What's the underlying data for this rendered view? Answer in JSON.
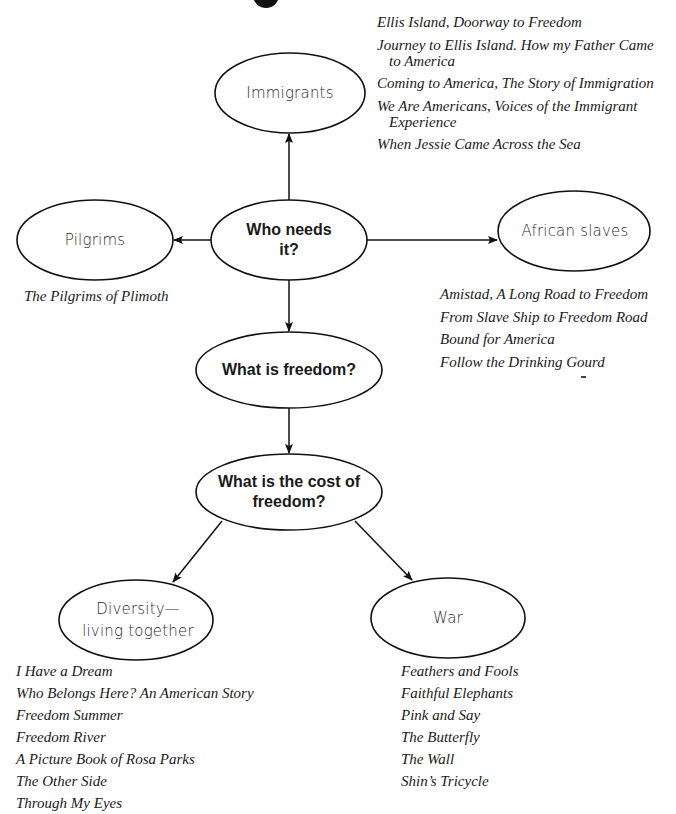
{
  "diagram": {
    "stroke_color": "#111111",
    "nodes": {
      "immigrants": {
        "label": "Immigrants"
      },
      "who_needs_it": {
        "label_line1": "Who needs",
        "label_line2": "it?"
      },
      "pilgrims": {
        "label": "Pilgrims"
      },
      "african_slaves": {
        "label": "African slaves"
      },
      "what_is_freedom": {
        "label": "What is freedom?"
      },
      "cost_of_freedom": {
        "label_line1": "What is the cost of",
        "label_line2": "freedom?"
      },
      "diversity": {
        "label_line1": "Diversity—",
        "label_line2": "living together"
      },
      "war": {
        "label": "War"
      }
    },
    "edges": [
      {
        "from": "who_needs_it",
        "to": "immigrants"
      },
      {
        "from": "who_needs_it",
        "to": "pilgrims"
      },
      {
        "from": "who_needs_it",
        "to": "african_slaves"
      },
      {
        "from": "who_needs_it",
        "to": "what_is_freedom"
      },
      {
        "from": "what_is_freedom",
        "to": "cost_of_freedom"
      },
      {
        "from": "cost_of_freedom",
        "to": "diversity"
      },
      {
        "from": "cost_of_freedom",
        "to": "war"
      }
    ]
  },
  "books": {
    "immigrants": [
      "Ellis Island, Doorway to Freedom",
      "Journey to Ellis Island. How my Father Came to America",
      "Coming to America, The Story of Immigration",
      "We Are Americans, Voices of the Immigrant Experience",
      "When Jessie Came Across the Sea"
    ],
    "pilgrims": [
      "The Pilgrims of Plimoth"
    ],
    "african_slaves": [
      "Amistad, A Long Road to Freedom",
      "From Slave Ship to Freedom Road",
      "Bound for America",
      "Follow the Drinking Gourd"
    ],
    "diversity": [
      "I Have a Dream",
      "Who Belongs Here?  An American Story",
      "Freedom Summer",
      "Freedom River",
      "A Picture Book of Rosa Parks",
      "The Other Side",
      "Through My Eyes"
    ],
    "war": [
      "Feathers and Fools",
      "Faithful Elephants",
      "Pink and Say",
      "The Butterfly",
      "The Wall",
      "Shin’s Tricycle"
    ]
  }
}
